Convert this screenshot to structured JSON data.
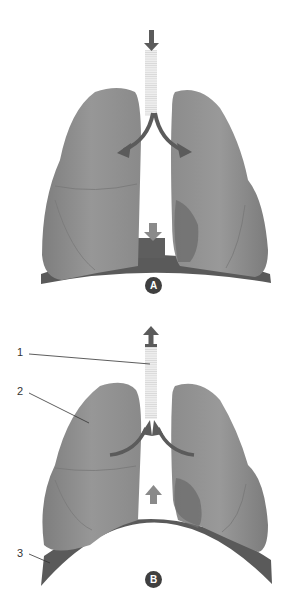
{
  "diagram": {
    "type": "anatomical-illustration",
    "colors": {
      "lung": "#8e8e8e",
      "lung_shadow": "#6e6e6e",
      "diaphragm": "#5a5a5a",
      "arrow": "#5b5b5b",
      "trachea": "#e6e6e6",
      "badge": "#3f3f3f",
      "leader_line": "#333333"
    },
    "panels": [
      {
        "id": "A",
        "badge": "A",
        "air_flow": "down (into lungs)",
        "diaphragm_motion": "down",
        "diaphragm_shape": "flattened"
      },
      {
        "id": "B",
        "badge": "B",
        "air_flow": "up (out of lungs)",
        "diaphragm_motion": "up",
        "diaphragm_shape": "domed"
      }
    ],
    "labels": [
      {
        "number": "1",
        "target": "trachea"
      },
      {
        "number": "2",
        "target": "lung"
      },
      {
        "number": "3",
        "target": "diaphragm"
      }
    ]
  }
}
